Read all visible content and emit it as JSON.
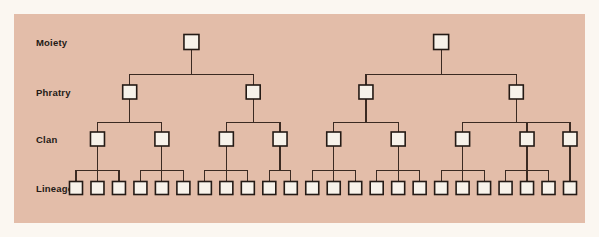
{
  "figure": {
    "background_color": "#fbf7f1",
    "panel_color": "#e3bda9",
    "node_fill": "#f7f2ea",
    "node_stroke": "#241a15",
    "line_color": "#3b2a22"
  },
  "chart_data": {
    "type": "tree",
    "levels": [
      {
        "key": "moiety",
        "label": "Moiety",
        "y": 28,
        "count": 2
      },
      {
        "key": "phratry",
        "label": "Phratry",
        "y": 78,
        "count": 4
      },
      {
        "key": "clan",
        "label": "Clan",
        "y": 125,
        "count": 9
      },
      {
        "key": "lineage",
        "label": "Lineage",
        "y": 174,
        "count": 24
      }
    ],
    "box_size": {
      "moiety": 15,
      "phratry": 14,
      "clan": 14,
      "lineage": 13
    },
    "nodes": {
      "moiety": [
        173,
        407
      ],
      "phratry": [
        111,
        235,
        341,
        475
      ],
      "clan": [
        79,
        137,
        197,
        273,
        317,
        373,
        429,
        489,
        545
      ],
      "lineage": [
        70,
        94,
        118,
        142,
        166,
        190,
        214,
        238,
        262,
        286,
        310,
        334,
        358,
        382,
        406,
        430,
        454,
        478,
        502,
        526,
        550,
        82,
        226,
        466
      ]
    },
    "edges": {
      "moiety_to_phratry": [
        {
          "parent": 0,
          "children": [
            0,
            1
          ]
        },
        {
          "parent": 1,
          "children": [
            2,
            3
          ]
        }
      ],
      "phratry_to_clan": [
        {
          "parent": 0,
          "children": [
            0,
            1
          ]
        },
        {
          "parent": 1,
          "children": [
            2,
            3
          ]
        },
        {
          "parent": 2,
          "children": [
            4,
            5
          ]
        },
        {
          "parent": 3,
          "children": [
            6,
            7,
            8
          ]
        }
      ],
      "clan_to_lineage": [
        {
          "parent": 0,
          "children": [
            0,
            1,
            2
          ]
        },
        {
          "parent": 1,
          "children": [
            3,
            4,
            5
          ]
        },
        {
          "parent": 2,
          "children": [
            6,
            7,
            8
          ]
        },
        {
          "parent": 3,
          "children": [
            9,
            10
          ]
        },
        {
          "parent": 4,
          "children": [
            11,
            12,
            13
          ]
        },
        {
          "parent": 5,
          "children": [
            14,
            15,
            16
          ]
        },
        {
          "parent": 6,
          "children": [
            17,
            18,
            19
          ]
        },
        {
          "parent": 7,
          "children": [
            20,
            21,
            22
          ]
        },
        {
          "parent": 8,
          "children": [
            23
          ]
        }
      ]
    },
    "xlabel": "",
    "ylabel": "",
    "legend": [],
    "grid": false
  },
  "labels": {
    "moiety": "Moiety",
    "phratry": "Phratry",
    "clan": "Clan",
    "lineage": "Lineage"
  }
}
